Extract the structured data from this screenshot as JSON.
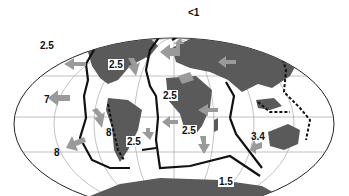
{
  "figure": {
    "type": "world map, plate motion velocities",
    "colors": {
      "ocean": "#ffffff",
      "land": "#5a5a5a",
      "arrow": "#9a9a9a",
      "boundary": "#111111",
      "grid": "#888888"
    }
  },
  "labels": [
    {
      "id": "l1",
      "text": "<1",
      "x": 188,
      "y": 12
    },
    {
      "id": "l2",
      "text": "2.5",
      "x": 46,
      "y": 44
    },
    {
      "id": "l3",
      "text": "2.5",
      "x": 108,
      "y": 58,
      "boxed": true
    },
    {
      "id": "l4",
      "text": "2.5",
      "x": 162,
      "y": 92,
      "boxed": true
    },
    {
      "id": "l5",
      "text": "7",
      "x": 45,
      "y": 95
    },
    {
      "id": "l6",
      "text": "8",
      "x": 106,
      "y": 128
    },
    {
      "id": "l7",
      "text": "2.5",
      "x": 126,
      "y": 137,
      "boxed": true
    },
    {
      "id": "l8",
      "text": "2.5",
      "x": 182,
      "y": 127,
      "boxed": true
    },
    {
      "id": "l9",
      "text": "8",
      "x": 56,
      "y": 148
    },
    {
      "id": "l10",
      "text": "3.4",
      "x": 250,
      "y": 132
    },
    {
      "id": "l11",
      "text": "1.5",
      "x": 219,
      "y": 178,
      "boxed": true
    }
  ]
}
